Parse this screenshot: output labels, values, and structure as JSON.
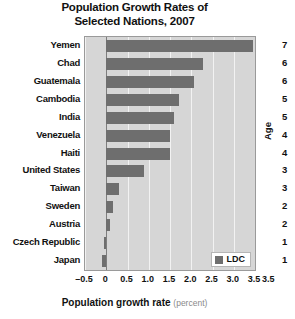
{
  "chart_data": {
    "type": "bar",
    "orientation": "horizontal",
    "title": "Population Growth Rates of Selected Nations, 2007",
    "title_line1": "Population Growth Rates of",
    "title_line2": "Selected Nations, 2007",
    "xlabel": "Population growth rate",
    "xlabel_units": "(percent)",
    "ylabel": "",
    "xlim": [
      -0.5,
      3.5
    ],
    "xticks": [
      -0.5,
      0,
      0.5,
      1.0,
      1.5,
      2.0,
      2.5,
      3.0,
      3.5
    ],
    "xticklabels": [
      "–0.5",
      "0",
      "0.5",
      "1.0",
      "1.5",
      "2.0",
      "2.5",
      "3.0",
      "3.5"
    ],
    "grid": true,
    "grid_axis": "x",
    "legend": {
      "position": "lower-right",
      "entries": [
        {
          "label": "LDC",
          "color": "#6e6e6e"
        }
      ]
    },
    "categories": [
      "Yemen",
      "Chad",
      "Guatemala",
      "Cambodia",
      "India",
      "Venezuela",
      "Haiti",
      "United States",
      "Taiwan",
      "Sweden",
      "Austria",
      "Czech Republic",
      "Japan"
    ],
    "values": [
      3.46,
      2.28,
      2.07,
      1.72,
      1.6,
      1.5,
      1.5,
      0.89,
      0.3,
      0.16,
      0.08,
      -0.06,
      -0.09
    ],
    "bar_color": "#6e6e6e",
    "plot_background": "#d6d6d6",
    "gridline_color": "#f2f2f2",
    "zero_line_color": "#7d7d7d"
  },
  "side_chart": {
    "axis_title": "Age",
    "tick_labels": [
      "7",
      "6",
      "6",
      "5",
      "5",
      "4",
      "4",
      "3",
      "3",
      "2",
      "2",
      "1",
      "1"
    ],
    "x_tick_label": "3.5",
    "note": "clipped adjacent figure at right edge"
  }
}
